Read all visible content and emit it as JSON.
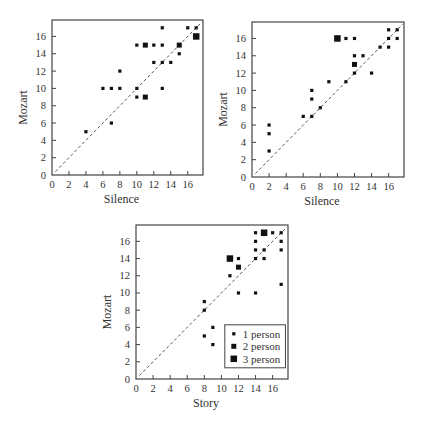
{
  "chart_data": [
    {
      "type": "scatter",
      "title": "",
      "xlabel": "Silence",
      "ylabel": "Mozart",
      "xlim": [
        0,
        17.8
      ],
      "ylim": [
        0,
        17.9
      ],
      "xticks": [
        0,
        2,
        4,
        6,
        8,
        10,
        12,
        14,
        16
      ],
      "yticks": [
        0,
        2,
        4,
        6,
        8,
        10,
        12,
        14,
        16
      ],
      "grid": false,
      "reference_line": "y = x (dashed)",
      "points": [
        {
          "x": 4,
          "y": 5,
          "n": 1
        },
        {
          "x": 6,
          "y": 10,
          "n": 1
        },
        {
          "x": 7,
          "y": 10,
          "n": 1
        },
        {
          "x": 7,
          "y": 6,
          "n": 1
        },
        {
          "x": 8,
          "y": 10,
          "n": 1
        },
        {
          "x": 8,
          "y": 12,
          "n": 1
        },
        {
          "x": 10,
          "y": 15,
          "n": 1
        },
        {
          "x": 10,
          "y": 10,
          "n": 1
        },
        {
          "x": 10,
          "y": 9,
          "n": 1
        },
        {
          "x": 11,
          "y": 15,
          "n": 2
        },
        {
          "x": 11,
          "y": 9,
          "n": 2
        },
        {
          "x": 12,
          "y": 15,
          "n": 1
        },
        {
          "x": 12,
          "y": 13,
          "n": 1
        },
        {
          "x": 13,
          "y": 17,
          "n": 1
        },
        {
          "x": 13,
          "y": 15,
          "n": 1
        },
        {
          "x": 13,
          "y": 13,
          "n": 1
        },
        {
          "x": 13,
          "y": 10,
          "n": 1
        },
        {
          "x": 14,
          "y": 13,
          "n": 1
        },
        {
          "x": 15,
          "y": 15,
          "n": 2
        },
        {
          "x": 15,
          "y": 14,
          "n": 1
        },
        {
          "x": 16,
          "y": 17,
          "n": 1
        },
        {
          "x": 17,
          "y": 17,
          "n": 1
        },
        {
          "x": 17,
          "y": 16,
          "n": 3
        }
      ]
    },
    {
      "type": "scatter",
      "title": "",
      "xlabel": "Silence",
      "ylabel": "Mozart",
      "xlim": [
        0,
        17.8
      ],
      "ylim": [
        0,
        17.9
      ],
      "xticks": [
        0,
        2,
        4,
        6,
        8,
        10,
        12,
        14,
        16
      ],
      "yticks": [
        0,
        2,
        4,
        6,
        8,
        10,
        12,
        14,
        16
      ],
      "grid": false,
      "reference_line": "y = x (dashed)",
      "points": [
        {
          "x": 2,
          "y": 6,
          "n": 1
        },
        {
          "x": 2,
          "y": 5,
          "n": 1
        },
        {
          "x": 2,
          "y": 3,
          "n": 1
        },
        {
          "x": 6,
          "y": 7,
          "n": 1
        },
        {
          "x": 7,
          "y": 10,
          "n": 1
        },
        {
          "x": 7,
          "y": 9,
          "n": 1
        },
        {
          "x": 7,
          "y": 7,
          "n": 1
        },
        {
          "x": 8,
          "y": 8,
          "n": 1
        },
        {
          "x": 9,
          "y": 11,
          "n": 1
        },
        {
          "x": 10,
          "y": 16,
          "n": 3
        },
        {
          "x": 11,
          "y": 16,
          "n": 1
        },
        {
          "x": 11,
          "y": 11,
          "n": 1
        },
        {
          "x": 12,
          "y": 16,
          "n": 1
        },
        {
          "x": 12,
          "y": 14,
          "n": 1
        },
        {
          "x": 12,
          "y": 13,
          "n": 2
        },
        {
          "x": 12,
          "y": 12,
          "n": 1
        },
        {
          "x": 13,
          "y": 14,
          "n": 1
        },
        {
          "x": 14,
          "y": 12,
          "n": 1
        },
        {
          "x": 15,
          "y": 15,
          "n": 1
        },
        {
          "x": 16,
          "y": 17,
          "n": 1
        },
        {
          "x": 16,
          "y": 16,
          "n": 1
        },
        {
          "x": 16,
          "y": 15,
          "n": 1
        },
        {
          "x": 17,
          "y": 17,
          "n": 1
        },
        {
          "x": 17,
          "y": 16,
          "n": 1
        }
      ]
    },
    {
      "type": "scatter",
      "title": "",
      "xlabel": "Story",
      "ylabel": "Mozart",
      "xlim": [
        0,
        17.8
      ],
      "ylim": [
        0,
        17.9
      ],
      "xticks": [
        0,
        2,
        4,
        6,
        8,
        10,
        12,
        14,
        16
      ],
      "yticks": [
        0,
        2,
        4,
        6,
        8,
        10,
        12,
        14,
        16
      ],
      "grid": false,
      "reference_line": "y = x (dashed)",
      "legend": {
        "position": "lower right",
        "entries": [
          {
            "label": "1 person",
            "n": 1
          },
          {
            "label": "2 person",
            "n": 2
          },
          {
            "label": "3 person",
            "n": 3
          }
        ]
      },
      "points": [
        {
          "x": 8,
          "y": 9,
          "n": 1
        },
        {
          "x": 8,
          "y": 8,
          "n": 1
        },
        {
          "x": 8,
          "y": 5,
          "n": 1
        },
        {
          "x": 9,
          "y": 6,
          "n": 1
        },
        {
          "x": 9,
          "y": 4,
          "n": 1
        },
        {
          "x": 11,
          "y": 14,
          "n": 3
        },
        {
          "x": 11,
          "y": 12,
          "n": 1
        },
        {
          "x": 12,
          "y": 14,
          "n": 1
        },
        {
          "x": 12,
          "y": 13,
          "n": 2
        },
        {
          "x": 12,
          "y": 10,
          "n": 1
        },
        {
          "x": 14,
          "y": 17,
          "n": 1
        },
        {
          "x": 14,
          "y": 16,
          "n": 1
        },
        {
          "x": 14,
          "y": 15,
          "n": 1
        },
        {
          "x": 14,
          "y": 14,
          "n": 1
        },
        {
          "x": 14,
          "y": 10,
          "n": 1
        },
        {
          "x": 15,
          "y": 17,
          "n": 3
        },
        {
          "x": 15,
          "y": 15,
          "n": 1
        },
        {
          "x": 15,
          "y": 14,
          "n": 1
        },
        {
          "x": 16,
          "y": 17,
          "n": 1
        },
        {
          "x": 17,
          "y": 17,
          "n": 1
        },
        {
          "x": 17,
          "y": 16,
          "n": 1
        },
        {
          "x": 17,
          "y": 15,
          "n": 1
        },
        {
          "x": 17,
          "y": 11,
          "n": 1
        }
      ]
    }
  ],
  "layout": {
    "plots": [
      {
        "left": 52,
        "top": 20,
        "width": 151,
        "height": 155
      },
      {
        "left": 252,
        "top": 22,
        "width": 152,
        "height": 155
      },
      {
        "left": 136,
        "top": 225,
        "width": 152,
        "height": 154
      }
    ]
  },
  "colors": {
    "marker": "#111111",
    "axis": "#444444",
    "reference_line": "#555555",
    "text": "#333333"
  }
}
